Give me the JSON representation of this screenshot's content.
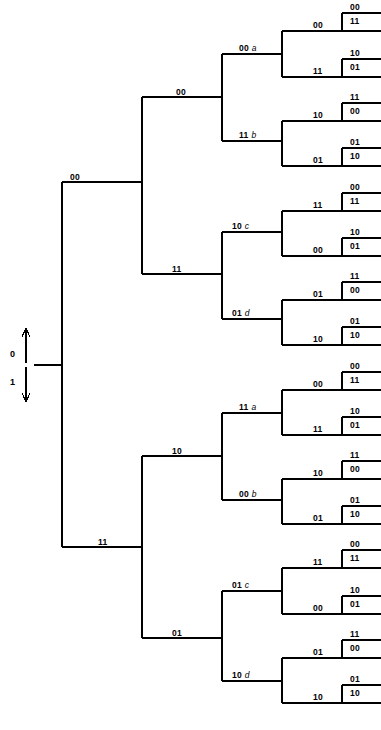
{
  "figure": {
    "type": "binary-tree-diagram",
    "line_color": "#000000",
    "background_color": "#ffffff"
  },
  "axis": {
    "up_arrow_label": "0",
    "down_arrow_label": "1",
    "up_icon": "arrow-up-icon",
    "down_icon": "arrow-down-icon"
  },
  "levels": {
    "level1": [
      {
        "id": "L1-top",
        "code": "00"
      },
      {
        "id": "L1-bot",
        "code": "11"
      }
    ],
    "level2": [
      {
        "id": "L2-1",
        "code": "00"
      },
      {
        "id": "L2-2",
        "code": "11"
      },
      {
        "id": "L2-3",
        "code": "10"
      },
      {
        "id": "L2-4",
        "code": "01"
      }
    ],
    "level3": [
      {
        "id": "L3-1",
        "code": "00",
        "letter": "a"
      },
      {
        "id": "L3-2",
        "code": "11",
        "letter": "b"
      },
      {
        "id": "L3-3",
        "code": "10",
        "letter": "c"
      },
      {
        "id": "L3-4",
        "code": "01",
        "letter": "d"
      },
      {
        "id": "L3-5",
        "code": "11",
        "letter": "a"
      },
      {
        "id": "L3-6",
        "code": "00",
        "letter": "b"
      },
      {
        "id": "L3-7",
        "code": "01",
        "letter": "c"
      },
      {
        "id": "L3-8",
        "code": "10",
        "letter": "d"
      }
    ],
    "level4": [
      {
        "id": "L4-1",
        "code": "00"
      },
      {
        "id": "L4-2",
        "code": "11"
      },
      {
        "id": "L4-3",
        "code": "10"
      },
      {
        "id": "L4-4",
        "code": "01"
      },
      {
        "id": "L4-5",
        "code": "11"
      },
      {
        "id": "L4-6",
        "code": "00"
      },
      {
        "id": "L4-7",
        "code": "01"
      },
      {
        "id": "L4-8",
        "code": "10"
      },
      {
        "id": "L4-9",
        "code": "00"
      },
      {
        "id": "L4-10",
        "code": "11"
      },
      {
        "id": "L4-11",
        "code": "10"
      },
      {
        "id": "L4-12",
        "code": "01"
      },
      {
        "id": "L4-13",
        "code": "11"
      },
      {
        "id": "L4-14",
        "code": "00"
      },
      {
        "id": "L4-15",
        "code": "01"
      },
      {
        "id": "L4-16",
        "code": "10"
      }
    ]
  },
  "leaves": [
    {
      "id": "leaf-1",
      "above": "00",
      "below": "11"
    },
    {
      "id": "leaf-2",
      "above": "10",
      "below": "01"
    },
    {
      "id": "leaf-3",
      "above": "11",
      "below": "00"
    },
    {
      "id": "leaf-4",
      "above": "01",
      "below": "10"
    },
    {
      "id": "leaf-5",
      "above": "00",
      "below": "11"
    },
    {
      "id": "leaf-6",
      "above": "10",
      "below": "01"
    },
    {
      "id": "leaf-7",
      "above": "11",
      "below": "00"
    },
    {
      "id": "leaf-8",
      "above": "01",
      "below": "10"
    },
    {
      "id": "leaf-9",
      "above": "00",
      "below": "11"
    },
    {
      "id": "leaf-10",
      "above": "10",
      "below": "01"
    },
    {
      "id": "leaf-11",
      "above": "11",
      "below": "00"
    },
    {
      "id": "leaf-12",
      "above": "01",
      "below": "10"
    },
    {
      "id": "leaf-13",
      "above": "00",
      "below": "11"
    },
    {
      "id": "leaf-14",
      "above": "10",
      "below": "01"
    },
    {
      "id": "leaf-15",
      "above": "11",
      "below": "00"
    },
    {
      "id": "leaf-16",
      "above": "01",
      "below": "10"
    }
  ]
}
